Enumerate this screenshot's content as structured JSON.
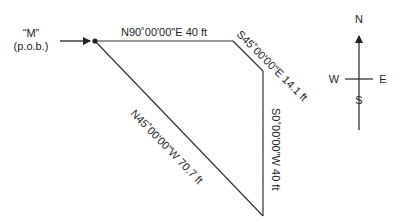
{
  "diagram": {
    "type": "survey-plat",
    "point_label_line1": "“M”",
    "point_label_line2": "(p.o.b.)",
    "courses": [
      {
        "bearing": "N90°00'00\"E",
        "distance": "40 ft",
        "label": "N90˚00'00\"E 40 ft"
      },
      {
        "bearing": "S45°00'00\"E",
        "distance": "14.1 ft",
        "label": "S45˚00'00\"E 14.1 ft"
      },
      {
        "bearing": "S0°00'00\"W",
        "distance": "40 ft",
        "label": "S0˚00'00\"W 40 ft"
      },
      {
        "bearing": "N45°00'00\"W",
        "distance": "70.7 ft",
        "label": "N45˚00'00\"W 70.7 ft"
      }
    ],
    "compass": {
      "north": "N",
      "south": "S",
      "east": "E",
      "west": "W"
    },
    "colors": {
      "line": "#333333",
      "text": "#222222",
      "background": "#ffffff"
    }
  }
}
